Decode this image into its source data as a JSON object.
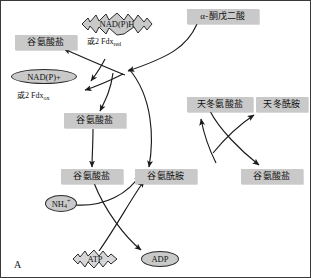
{
  "figure": {
    "panel_letter": "A",
    "type": "metabolic-pathway-diagram",
    "background": "#ffffff",
    "border_color": "#3a3a3a",
    "box_fill": "#c9c9c9",
    "shape_outline": "#2b2b2b",
    "arrow_color": "#1a1a1a"
  },
  "nodes": {
    "alpha_ketoglutarate": {
      "label": "α-酮戊二酸",
      "shape": "box"
    },
    "nadph": {
      "label": "NAD(P)H",
      "shape": "starburst"
    },
    "nadph_alt": {
      "label": "或2 Fdx",
      "sub": "red",
      "shape": "text"
    },
    "nadp_plus": {
      "label": "NAD(P)+",
      "shape": "ellipse"
    },
    "nadp_plus_alt": {
      "label": "或2 Fdx",
      "sub": "ox",
      "shape": "text"
    },
    "glutamate_top_left": {
      "label": "谷氨酸盐",
      "shape": "box"
    },
    "glutamate_mid_left": {
      "label": "谷氨酸盐",
      "shape": "box"
    },
    "glutamate_bottom_left": {
      "label": "谷氨酸盐",
      "shape": "box"
    },
    "glutamine_bottom_mid": {
      "label": "谷氨酰胺",
      "shape": "box"
    },
    "glutamate_bottom_right": {
      "label": "谷氨酸盐",
      "shape": "box"
    },
    "aspartate": {
      "label": "天冬氨酸盐",
      "shape": "box"
    },
    "asparagine": {
      "label": "天冬酰胺",
      "shape": "box"
    },
    "ammonium": {
      "label": "NH",
      "sub": "4",
      "sup": "+",
      "shape": "ellipse"
    },
    "atp": {
      "label": "ATP",
      "shape": "starburst"
    },
    "adp": {
      "label": "ADP",
      "shape": "ellipse"
    }
  }
}
